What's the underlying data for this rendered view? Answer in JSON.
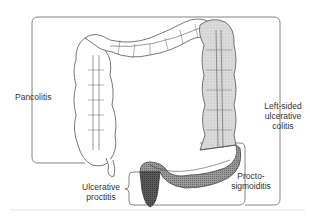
{
  "diagram": {
    "labels": {
      "pancolitis": "Pancolitis",
      "left_sided": [
        "Left-sided",
        "ulcerative",
        "colitis"
      ],
      "proctosigmoiditis": [
        "Procto-",
        "sigmoiditis"
      ],
      "ulcerative_proctitis": [
        "Ulcerative",
        "proctitis"
      ]
    },
    "colors": {
      "outline": "#555555",
      "bracket": "#777777",
      "light_shade": "#d8d8d8",
      "medium_shade": "#8a8a8a",
      "dark_shade": "#4a4a4a",
      "background": "#ffffff"
    }
  }
}
